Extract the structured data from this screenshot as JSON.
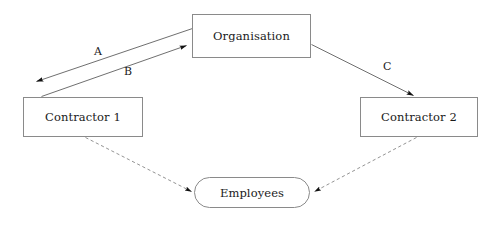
{
  "diagram": {
    "background_color": "#ffffff",
    "line_color": "#555555",
    "text_color": "#1a1a1a",
    "box_border_color": "#8a8a8a",
    "nodes": [
      {
        "id": "organisation",
        "label": "Organisation",
        "shape": "rectangle",
        "x": 192,
        "y": 14,
        "width": 119,
        "height": 44
      },
      {
        "id": "contractor1",
        "label": "Contractor 1",
        "shape": "rectangle",
        "x": 23,
        "y": 97,
        "width": 120,
        "height": 40
      },
      {
        "id": "contractor2",
        "label": "Contractor 2",
        "shape": "rectangle",
        "x": 360,
        "y": 97,
        "width": 118,
        "height": 40
      },
      {
        "id": "employees",
        "label": "Employees",
        "shape": "rounded-rectangle",
        "x": 194,
        "y": 177,
        "width": 116,
        "height": 31
      }
    ],
    "edges": [
      {
        "id": "edge-a",
        "label": "A",
        "from": "organisation",
        "to": "contractor1",
        "style": "solid",
        "arrowhead": "filled-triangle",
        "label_x": 94,
        "label_y": 46
      },
      {
        "id": "edge-b",
        "label": "B",
        "from": "contractor1",
        "to": "organisation",
        "style": "solid",
        "arrowhead": "filled-triangle",
        "label_x": 124,
        "label_y": 66
      },
      {
        "id": "edge-c",
        "label": "C",
        "from": "organisation",
        "to": "contractor2",
        "style": "solid",
        "arrowhead": "filled-triangle",
        "label_x": 383,
        "label_y": 61
      },
      {
        "id": "edge-contractor1-employees",
        "label": "",
        "from": "contractor1",
        "to": "employees",
        "style": "dashed",
        "arrowhead": "filled-triangle"
      },
      {
        "id": "edge-contractor2-employees",
        "label": "",
        "from": "contractor2",
        "to": "employees",
        "style": "dashed",
        "arrowhead": "filled-triangle"
      }
    ]
  }
}
